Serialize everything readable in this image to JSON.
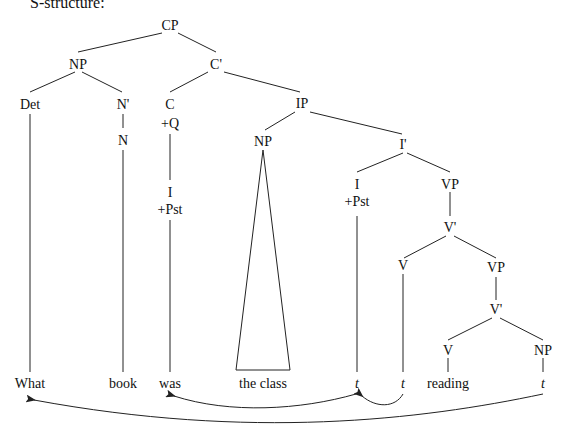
{
  "header": {
    "text": "S-structure:"
  },
  "tree": {
    "nodes": {
      "CP": "CP",
      "NP1": "NP",
      "Cbar": "C'",
      "Det": "Det",
      "Nbar": "N'",
      "N": "N",
      "C": "C",
      "Cfeat": "+Q",
      "IP": "IP",
      "NP2": "NP",
      "Ibar": "I'",
      "Ihi": "I",
      "Ihifeat": "+Pst",
      "Ilo": "I",
      "Ilofeat": "+Pst",
      "VP1": "VP",
      "Vbar1": "V'",
      "V1": "V",
      "VP2": "VP",
      "Vbar2": "V'",
      "V2": "V",
      "NP3": "NP"
    },
    "leaves": [
      "What",
      "book",
      "was",
      "the class",
      "t",
      "t",
      "reading",
      "t"
    ]
  },
  "arrows": [
    {
      "from": "t (I trace)",
      "to": "was"
    },
    {
      "from": "t (V trace)",
      "to": "t (I trace)"
    },
    {
      "from": "t (object trace)",
      "to": "What"
    }
  ]
}
